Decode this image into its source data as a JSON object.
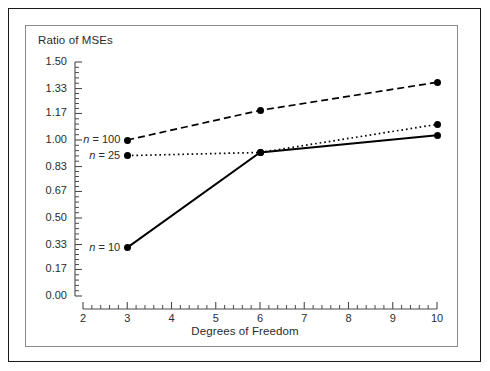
{
  "chart_data": {
    "type": "line",
    "title": "",
    "ylabel": "Ratio of MSEs",
    "xlabel": "Degrees of Freedom",
    "xlim": [
      2,
      10
    ],
    "ylim": [
      0.0,
      1.5
    ],
    "grid": false,
    "legend_position": "inline-left",
    "x_ticks": [
      "2",
      "3",
      "4",
      "5",
      "6",
      "7",
      "8",
      "9",
      "10"
    ],
    "x_tick_values": [
      2,
      3,
      4,
      5,
      6,
      7,
      8,
      9,
      10
    ],
    "y_ticks": [
      "0.00",
      "0.17",
      "0.33",
      "0.50",
      "0.67",
      "0.83",
      "1.00",
      "1.17",
      "1.33",
      "1.50"
    ],
    "y_tick_values": [
      0.0,
      0.17,
      0.33,
      0.5,
      0.67,
      0.83,
      1.0,
      1.17,
      1.33,
      1.5
    ],
    "series": [
      {
        "name": "n = 100",
        "label_prefix": "n",
        "label_suffix": "= 100",
        "style": "dashed",
        "x": [
          3,
          6,
          10
        ],
        "values": [
          1.0,
          1.19,
          1.37
        ]
      },
      {
        "name": "n = 25",
        "label_prefix": "n",
        "label_suffix": "= 25",
        "style": "dotted",
        "x": [
          3,
          6,
          10
        ],
        "values": [
          0.9,
          0.92,
          1.1
        ]
      },
      {
        "name": "n = 10",
        "label_prefix": "n",
        "label_suffix": "= 10",
        "style": "solid",
        "x": [
          3,
          6,
          10
        ],
        "values": [
          0.31,
          0.92,
          1.03
        ]
      }
    ],
    "colors": {
      "line": "#000000",
      "marker": "#000000",
      "axis": "#4a4a4a",
      "text": "#2b2b2b",
      "outer_border": "#1a1a1a",
      "inner_border": "#8a8a8a",
      "background": "#ffffff"
    }
  }
}
